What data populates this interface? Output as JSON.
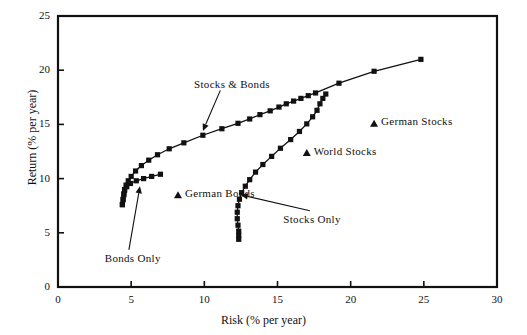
{
  "chart_data": {
    "type": "scatter",
    "title": "",
    "xlabel": "Risk (% per year)",
    "ylabel": "Return (% per year)",
    "xlim": [
      0,
      30
    ],
    "ylim": [
      0,
      25
    ],
    "xticks": [
      0,
      5,
      10,
      15,
      20,
      25,
      30
    ],
    "yticks": [
      0,
      5,
      10,
      15,
      20,
      25
    ],
    "grid": false,
    "legend": "none",
    "series": [
      {
        "name": "Stocks & Bonds",
        "marker": "filled-square",
        "line": true,
        "points": [
          [
            4.4,
            7.6
          ],
          [
            4.45,
            8.1
          ],
          [
            4.5,
            8.6
          ],
          [
            4.55,
            9.0
          ],
          [
            4.65,
            9.4
          ],
          [
            4.8,
            9.8
          ],
          [
            5.0,
            10.2
          ],
          [
            5.3,
            10.7
          ],
          [
            5.7,
            11.2
          ],
          [
            6.2,
            11.7
          ],
          [
            6.8,
            12.2
          ],
          [
            7.6,
            12.75
          ],
          [
            8.6,
            13.3
          ],
          [
            9.9,
            14.0
          ],
          [
            11.2,
            14.6
          ],
          [
            12.3,
            15.1
          ],
          [
            13.1,
            15.5
          ],
          [
            13.8,
            15.9
          ],
          [
            14.5,
            16.25
          ],
          [
            15.1,
            16.6
          ],
          [
            15.6,
            16.9
          ],
          [
            16.1,
            17.15
          ],
          [
            16.6,
            17.4
          ],
          [
            17.1,
            17.65
          ],
          [
            17.6,
            17.9
          ],
          [
            19.2,
            18.8
          ],
          [
            21.6,
            19.9
          ],
          [
            24.8,
            21.0
          ]
        ]
      },
      {
        "name": "Stocks Only",
        "marker": "filled-square",
        "line": true,
        "points": [
          [
            12.35,
            4.4
          ],
          [
            12.35,
            4.75
          ],
          [
            12.35,
            5.15
          ],
          [
            12.3,
            5.7
          ],
          [
            12.25,
            6.3
          ],
          [
            12.25,
            6.9
          ],
          [
            12.3,
            7.5
          ],
          [
            12.4,
            8.1
          ],
          [
            12.55,
            8.7
          ],
          [
            12.8,
            9.3
          ],
          [
            13.1,
            9.9
          ],
          [
            13.5,
            10.6
          ],
          [
            14.0,
            11.3
          ],
          [
            14.6,
            12.05
          ],
          [
            15.2,
            12.8
          ],
          [
            15.9,
            13.6
          ],
          [
            16.5,
            14.35
          ],
          [
            17.0,
            15.05
          ],
          [
            17.4,
            15.7
          ],
          [
            17.7,
            16.3
          ],
          [
            17.9,
            16.9
          ],
          [
            18.1,
            17.4
          ],
          [
            18.3,
            17.8
          ]
        ]
      },
      {
        "name": "Bonds Only",
        "marker": "filled-square",
        "line": true,
        "points": [
          [
            4.4,
            7.6
          ],
          [
            4.45,
            8.05
          ],
          [
            4.5,
            8.5
          ],
          [
            4.55,
            8.9
          ],
          [
            4.7,
            9.25
          ],
          [
            4.95,
            9.55
          ],
          [
            5.35,
            9.8
          ],
          [
            5.85,
            10.0
          ],
          [
            6.4,
            10.2
          ],
          [
            7.0,
            10.4
          ]
        ]
      }
    ],
    "single_points": [
      {
        "label": "German Stocks",
        "marker": "filled-triangle",
        "x": 21.6,
        "y": 15.1,
        "label_side": "right"
      },
      {
        "label": "World Stocks",
        "marker": "filled-triangle",
        "x": 17.0,
        "y": 12.4,
        "label_side": "right"
      },
      {
        "label": "German Bonds",
        "marker": "filled-triangle",
        "x": 8.2,
        "y": 8.5,
        "label_side": "right"
      }
    ],
    "annotations": [
      {
        "text": "Stocks & Bonds",
        "text_x": 9.3,
        "text_y": 18.6,
        "tip_x": 9.9,
        "tip_y": 14.4,
        "arrow": true
      },
      {
        "text": "Bonds Only",
        "text_x": 3.2,
        "text_y": 2.6,
        "tip_x": 5.6,
        "tip_y": 9.3,
        "arrow": true
      },
      {
        "text": "Stocks Only",
        "text_x": 15.4,
        "text_y": 6.2,
        "tip_x": 12.5,
        "tip_y": 8.5,
        "arrow": true
      }
    ]
  },
  "labels": {
    "xaxis": "Risk (% per year)",
    "yaxis": "Return (% per year)",
    "xticks": [
      "0",
      "5",
      "10",
      "15",
      "20",
      "25",
      "30"
    ],
    "yticks": [
      "0",
      "5",
      "10",
      "15",
      "20",
      "25"
    ],
    "annotation_stocks_bonds": "Stocks & Bonds",
    "annotation_bonds_only": "Bonds Only",
    "annotation_stocks_only": "Stocks Only",
    "marker_german_stocks": "German Stocks",
    "marker_world_stocks": "World Stocks",
    "marker_german_bonds": "German Bonds"
  },
  "style": {
    "ink": "#111111",
    "background": "#ffffff"
  }
}
